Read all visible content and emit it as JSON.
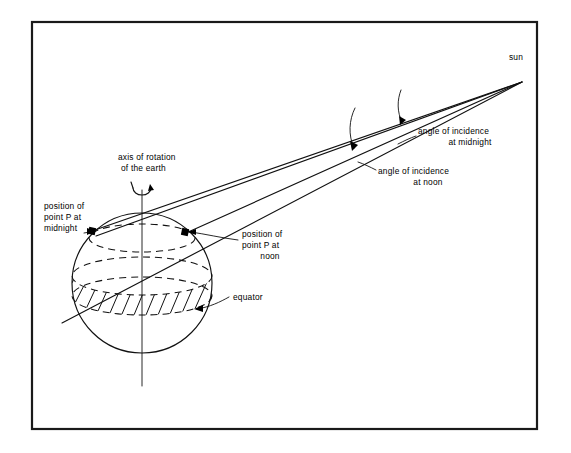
{
  "figure": {
    "type": "diagram",
    "background_color": "#ffffff",
    "ink_color": "#111111"
  },
  "labels": {
    "sun": "sun",
    "angle_midnight_line1": "angle of incidence",
    "angle_midnight_line2": "at midnight",
    "angle_noon_line1": "angle of incidence",
    "angle_noon_line2": "at noon",
    "axis_line1": "axis of rotation",
    "axis_line2": "of the earth",
    "midnight_line1": "position of",
    "midnight_line2": "point P at",
    "midnight_line3": "midnight",
    "noon_line1": "position of",
    "noon_line2": "point P at",
    "noon_line3": "noon",
    "equator": "equator"
  },
  "icons": {
    "rotation_arrow": "rotation-arrow-icon",
    "arrowhead": "arrowhead-icon",
    "angle_arc": "angle-arc-icon"
  },
  "geometry": {
    "frame": {
      "x": 32,
      "y": 22,
      "width": 505,
      "height": 407
    },
    "earth": {
      "cx": 142,
      "cy": 283,
      "r": 70
    },
    "sun_point": {
      "x": 522,
      "y": 82
    },
    "point_p_midnight": {
      "x": 92,
      "y": 231
    },
    "point_p_noon": {
      "x": 185,
      "y": 232
    },
    "axis": {
      "x": 142,
      "y_top": 190,
      "y_bottom": 386
    },
    "equator_ellipse": {
      "cx": 142,
      "cy": 296,
      "rx": 70,
      "ry": 19
    },
    "latitude_ellipse": {
      "cx": 142,
      "cy": 238,
      "rx": 53,
      "ry": 14
    },
    "hatch_band_top_ellipse": {
      "cx": 142,
      "cy": 276,
      "rx": 70,
      "ry": 19
    }
  }
}
